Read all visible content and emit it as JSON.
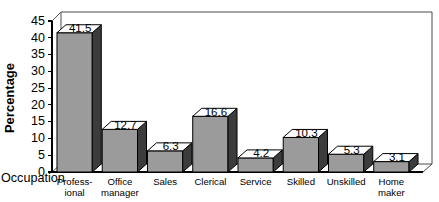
{
  "chart_data": {
    "type": "bar",
    "title": "",
    "subtitle": "",
    "xlabel": "Occupation",
    "ylabel": "Percentage",
    "categories": [
      "Profess-\nional",
      "Office\nmanager",
      "Sales",
      "Clerical",
      "Service",
      "Skilled",
      "Unskilled",
      "Home\nmaker"
    ],
    "values": [
      41.5,
      12.7,
      6.3,
      16.6,
      4.2,
      10.3,
      5.3,
      3.1
    ],
    "value_labels": [
      "41.5",
      "12.7",
      "6.3",
      "16.6",
      "4.2",
      "10.3",
      "5.3",
      "3.1"
    ],
    "ylim": [
      0,
      45
    ],
    "ytick_step": 5,
    "ytick_labels": [
      "0",
      "5",
      "10",
      "15",
      "20",
      "25",
      "30",
      "35",
      "40",
      "45"
    ],
    "ytick_values": [
      0,
      5,
      10,
      15,
      20,
      25,
      30,
      35,
      40,
      45
    ],
    "grid": false,
    "legend": null,
    "legend_position": "none",
    "style": "3d-bar",
    "colors": {
      "bar_front": "#9b9b9b",
      "bar_side": "#3c3c3c",
      "bar_top": "#ffffff",
      "outline": "#000000",
      "background": "#ffffff",
      "wall": "#4a4a4a"
    }
  }
}
